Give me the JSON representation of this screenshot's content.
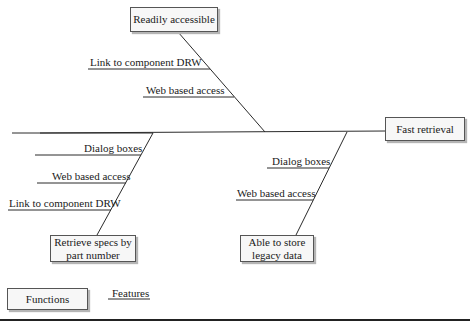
{
  "diagram": {
    "type": "fishbone",
    "head": "Fast retrieval",
    "categories": [
      {
        "label": "Readily accessible",
        "position": "top",
        "causes": [
          "Link to component DRW",
          "Web based access"
        ]
      },
      {
        "label": "Retrieve specs by part number",
        "position": "bottom-left",
        "causes": [
          "Dialog boxes",
          "Web based access",
          "Link to component DRW"
        ]
      },
      {
        "label": "Able to store legacy data",
        "position": "bottom-right",
        "causes": [
          "Dialog boxes",
          "Web based access"
        ]
      }
    ],
    "legend": {
      "box_label": "Functions",
      "line_label": "Features"
    }
  },
  "boxes": {
    "head": "Fast retrieval",
    "top": "Readily accessible",
    "bottom_left_l1": "Retrieve specs by",
    "bottom_left_l2": "part number",
    "bottom_right_l1": "Able to store",
    "bottom_right_l2": "legacy data"
  },
  "labels": {
    "top_1": "Link to component DRW",
    "top_2": "Web based access",
    "bl_1": "Dialog boxes",
    "bl_2": "Web based access",
    "bl_3": "Link to component DRW",
    "br_1": "Dialog boxes",
    "br_2": "Web based access"
  },
  "legend": {
    "functions": "Functions",
    "features": "Features"
  }
}
